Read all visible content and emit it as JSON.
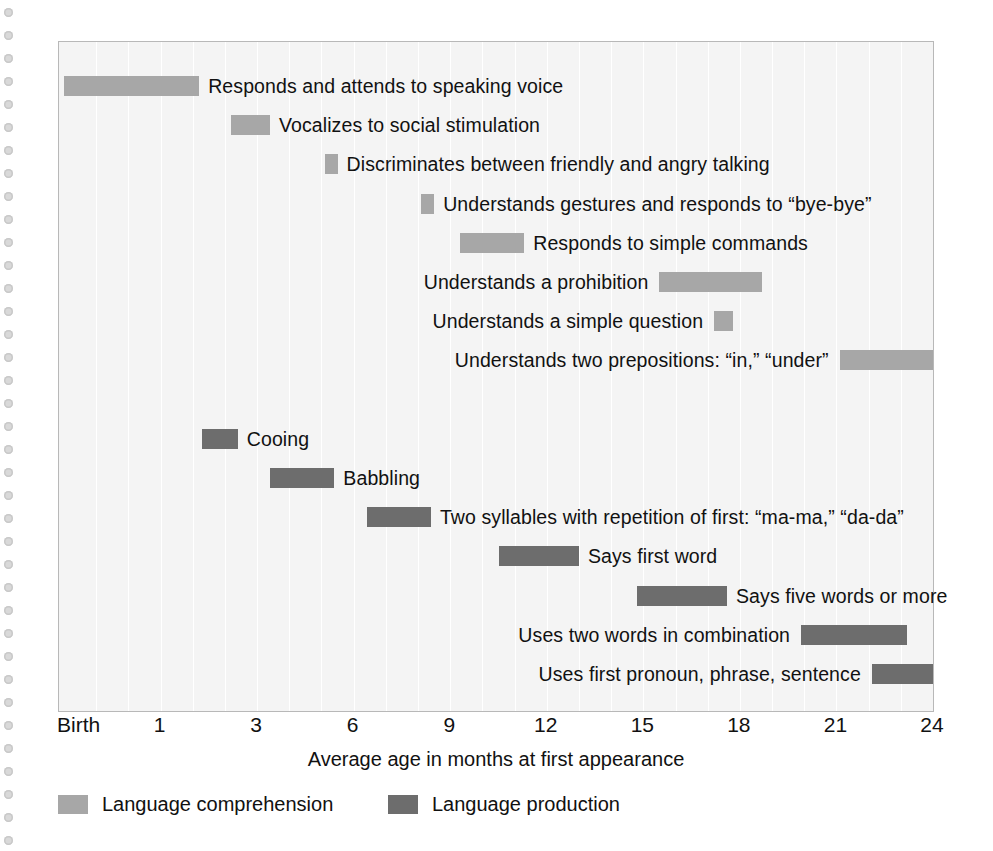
{
  "chart_data": {
    "type": "bar",
    "title": "",
    "subtitle": "",
    "xlabel": "Average age in months at first appearance",
    "ylabel": "",
    "orientation": "horizontal",
    "style": "gantt-range-bars",
    "grid": true,
    "axis_tick_labels": [
      "Birth",
      "1",
      "3",
      "6",
      "9",
      "12",
      "15",
      "18",
      "21",
      "24"
    ],
    "axis_tick_values": [
      0,
      1,
      3,
      6,
      9,
      12,
      15,
      18,
      21,
      24
    ],
    "axis_note": "Tick labels are evenly spaced on the drawn axis (Birth, 1, then every 3 months).",
    "xlim": [
      0,
      27
    ],
    "legend_position": "below-left",
    "colors": {
      "comprehension": "#a7a7a7",
      "production": "#6d6d6d",
      "plot_background": "#f4f4f4",
      "gridline": "#ffffff",
      "frame": "#b8b8b8",
      "text": "#111111",
      "binding_dot": "#d9d9d9",
      "page_background": "#ffffff"
    },
    "legend": [
      {
        "name": "Language comprehension",
        "color": "#a7a7a7",
        "key": "comprehension"
      },
      {
        "name": "Language production",
        "color": "#6d6d6d",
        "key": "production"
      }
    ],
    "series": [
      {
        "name": "Language comprehension",
        "key": "comprehension",
        "items": [
          {
            "label": "Responds and attends to speaking voice",
            "start_tick": 0.0,
            "end_tick": 4.2,
            "label_side": "after"
          },
          {
            "label": "Vocalizes to social stimulation",
            "start_tick": 5.2,
            "end_tick": 6.4,
            "label_side": "after"
          },
          {
            "label": "Discriminates between friendly and angry talking",
            "start_tick": 8.1,
            "end_tick": 8.5,
            "label_side": "after"
          },
          {
            "label": "Understands gestures and responds to “bye-bye”",
            "start_tick": 11.1,
            "end_tick": 11.5,
            "label_side": "after"
          },
          {
            "label": "Responds to simple commands",
            "start_tick": 12.3,
            "end_tick": 14.3,
            "label_side": "after"
          },
          {
            "label": "Understands a prohibition",
            "start_tick": 18.5,
            "end_tick": 21.7,
            "label_side": "before"
          },
          {
            "label": "Understands a simple question",
            "start_tick": 20.2,
            "end_tick": 20.8,
            "label_side": "before"
          },
          {
            "label": "Understands two prepositions: “in,” “under”",
            "start_tick": 24.1,
            "end_tick": 27.0,
            "label_side": "before"
          }
        ]
      },
      {
        "name": "Language production",
        "key": "production",
        "items": [
          {
            "label": "Cooing",
            "start_tick": 4.3,
            "end_tick": 5.4,
            "label_side": "after"
          },
          {
            "label": "Babbling",
            "start_tick": 6.4,
            "end_tick": 8.4,
            "label_side": "after"
          },
          {
            "label": "Two syllables with repetition of first: “ma-ma,” “da-da”",
            "start_tick": 9.4,
            "end_tick": 11.4,
            "label_side": "after"
          },
          {
            "label": "Says first word",
            "start_tick": 13.5,
            "end_tick": 16.0,
            "label_side": "after"
          },
          {
            "label": "Says five words or more",
            "start_tick": 17.8,
            "end_tick": 20.6,
            "label_side": "after"
          },
          {
            "label": "Uses two words in combination",
            "start_tick": 22.9,
            "end_tick": 26.2,
            "label_side": "before"
          },
          {
            "label": "Uses first pronoun, phrase, sentence",
            "start_tick": 25.1,
            "end_tick": 27.0,
            "label_side": "before"
          }
        ]
      }
    ],
    "rows": [
      {
        "label": "Responds and attends to speaking voice",
        "series": "comprehension",
        "start": 0.0,
        "end": 4.2,
        "label_side": "after"
      },
      {
        "label": "Vocalizes to social stimulation",
        "series": "comprehension",
        "start": 5.2,
        "end": 6.4,
        "label_side": "after"
      },
      {
        "label": "Discriminates between friendly and angry talking",
        "series": "comprehension",
        "start": 8.1,
        "end": 8.5,
        "label_side": "after"
      },
      {
        "label": "Understands gestures and responds to “bye-bye”",
        "series": "comprehension",
        "start": 11.1,
        "end": 11.5,
        "label_side": "after"
      },
      {
        "label": "Responds to simple commands",
        "series": "comprehension",
        "start": 12.3,
        "end": 14.3,
        "label_side": "after"
      },
      {
        "label": "Understands a prohibition",
        "series": "comprehension",
        "start": 18.5,
        "end": 21.7,
        "label_side": "before"
      },
      {
        "label": "Understands a simple question",
        "series": "comprehension",
        "start": 20.2,
        "end": 20.8,
        "label_side": "before"
      },
      {
        "label": "Understands two prepositions: “in,” “under”",
        "series": "comprehension",
        "start": 24.1,
        "end": 27.0,
        "label_side": "before"
      },
      {
        "label": "",
        "series": "spacer",
        "start": 0,
        "end": 0,
        "label_side": "after"
      },
      {
        "label": "Cooing",
        "series": "production",
        "start": 4.3,
        "end": 5.4,
        "label_side": "after"
      },
      {
        "label": "Babbling",
        "series": "production",
        "start": 6.4,
        "end": 8.4,
        "label_side": "after"
      },
      {
        "label": "Two syllables with repetition of first: “ma-ma,” “da-da”",
        "series": "production",
        "start": 9.4,
        "end": 11.4,
        "label_side": "after"
      },
      {
        "label": "Says first word",
        "series": "production",
        "start": 13.5,
        "end": 16.0,
        "label_side": "after"
      },
      {
        "label": "Says five words or more",
        "series": "production",
        "start": 17.8,
        "end": 20.6,
        "label_side": "after"
      },
      {
        "label": "Uses two words in combination",
        "series": "production",
        "start": 22.9,
        "end": 26.2,
        "label_side": "before"
      },
      {
        "label": "Uses first pronoun, phrase, sentence",
        "series": "production",
        "start": 25.1,
        "end": 27.0,
        "label_side": "before"
      }
    ]
  }
}
